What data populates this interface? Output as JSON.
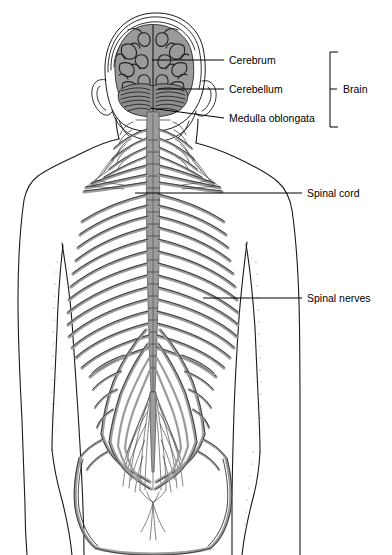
{
  "labels": [
    {
      "id": "cerebrum",
      "text": "Cerebrum",
      "x": 229,
      "y": 64
    },
    {
      "id": "cerebellum",
      "text": "Cerebellum",
      "x": 229,
      "y": 93
    },
    {
      "id": "medulla",
      "text": "Medulla oblongata",
      "x": 229,
      "y": 122
    },
    {
      "id": "brain",
      "text": "Brain",
      "x": 347,
      "y": 93
    },
    {
      "id": "spinal-cord",
      "text": "Spinal cord",
      "x": 307,
      "y": 196
    },
    {
      "id": "spinal-nerves",
      "text": "Spinal nerves",
      "x": 307,
      "y": 301
    }
  ],
  "structures": [
    {
      "id": "cerebrum",
      "name": "Cerebrum"
    },
    {
      "id": "cerebellum",
      "name": "Cerebellum"
    },
    {
      "id": "medulla",
      "name": "Medulla oblongata"
    },
    {
      "id": "spinal-cord",
      "name": "Spinal cord"
    },
    {
      "id": "spinal-nerves",
      "name": "Spinal nerves"
    },
    {
      "id": "cauda-equina",
      "name": "Cauda equina"
    },
    {
      "id": "sciatic-nerve",
      "name": "Sciatic nerve"
    }
  ],
  "bracket": {
    "group_label": "Brain",
    "members": [
      "Cerebrum",
      "Cerebellum",
      "Medulla oblongata"
    ]
  },
  "colors": {
    "ink": "#1a1a1a",
    "nerve_gray": "#9c9c9c",
    "brain_gray": "#9a9a9a",
    "cerebellum_gray": "#8e8e8e",
    "background": "#ffffff"
  }
}
